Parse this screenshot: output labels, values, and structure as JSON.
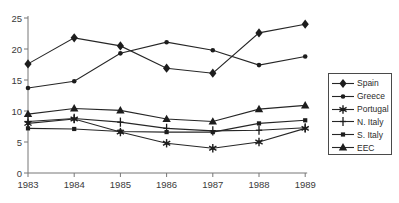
{
  "chart_data": {
    "type": "line",
    "title": "",
    "xlabel": "",
    "ylabel": "",
    "x": [
      1983,
      1984,
      1985,
      1986,
      1987,
      1988,
      1989
    ],
    "series": [
      {
        "name": "Spain",
        "marker": "diamond",
        "values": [
          17.6,
          21.8,
          20.5,
          16.9,
          16.1,
          22.6,
          24.0
        ]
      },
      {
        "name": "Greece",
        "marker": "circle",
        "values": [
          13.7,
          14.8,
          19.3,
          21.1,
          19.8,
          17.4,
          18.8
        ]
      },
      {
        "name": "Portugal",
        "marker": "star",
        "values": [
          8.0,
          8.7,
          6.6,
          4.8,
          4.0,
          5.0,
          7.2
        ]
      },
      {
        "name": "N. Italy",
        "marker": "plus",
        "values": [
          8.3,
          8.8,
          8.2,
          7.2,
          6.8,
          6.9,
          7.3
        ]
      },
      {
        "name": "S. Italy",
        "marker": "square",
        "values": [
          7.2,
          7.1,
          6.7,
          6.6,
          6.6,
          8.0,
          8.5
        ]
      },
      {
        "name": "EEC",
        "marker": "triangle",
        "values": [
          9.5,
          10.4,
          10.1,
          8.7,
          8.3,
          10.3,
          10.9
        ]
      }
    ],
    "ylim": [
      0,
      25
    ],
    "yticks": [
      0,
      5,
      10,
      15,
      20,
      25
    ],
    "grid": false,
    "legend_position": "right",
    "line_color": "#262626",
    "marker_color": "#1d1d1d",
    "axis_color": "#777777",
    "text_color": "#3a3a3a",
    "background": "#ffffff"
  }
}
